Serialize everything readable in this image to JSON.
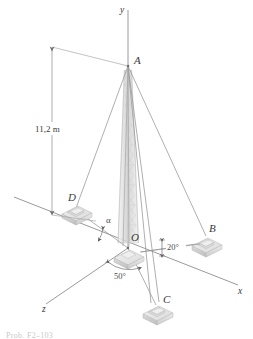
{
  "figure": {
    "type": "engineering-statics-diagram",
    "background_color": "#ffffff",
    "line_color": "#8a8a8a",
    "label_color": "#3a3a3a",
    "tower_color": "#cfcfcf",
    "block_top_color": "#e9e9e9",
    "block_side_color": "#d2d2d2",
    "axes": {
      "y_label": "y",
      "x_label": "x",
      "z_label": "z"
    },
    "points": {
      "A": "A",
      "B": "B",
      "C": "C",
      "D": "D",
      "O": "O"
    },
    "dimensions": [
      {
        "name": "tower-height",
        "value": "11,2 m",
        "from": "ground-level",
        "to": "A"
      }
    ],
    "angles": [
      {
        "name": "alpha-angle",
        "label": "α",
        "at": "O",
        "between": "OD and x-axis"
      },
      {
        "name": "angle-20",
        "label": "20°",
        "at": "O",
        "between": "OB and x-axis"
      },
      {
        "name": "angle-50",
        "label": "50°",
        "at": "O",
        "between": "OC and z-axis"
      }
    ],
    "cables": [
      {
        "name": "cable-AB",
        "from": "A",
        "to": "B"
      },
      {
        "name": "cable-AC",
        "from": "A",
        "to": "C"
      },
      {
        "name": "cable-AD",
        "from": "A",
        "to": "D"
      }
    ],
    "caption": "Prob. F2–103"
  }
}
